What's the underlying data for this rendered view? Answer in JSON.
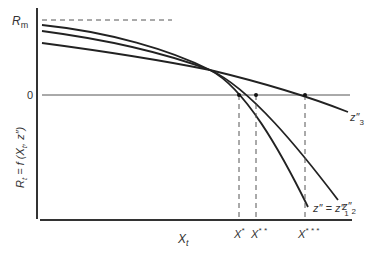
{
  "diagram": {
    "type": "economics-curve-diagram",
    "y_axis_label": {
      "main": "R",
      "sub": "t",
      "rest": " = f (X",
      "sub2": "t",
      "rest2": ", z″)"
    },
    "x_axis_label": {
      "main": "X",
      "sub": "t"
    },
    "y_ticks": {
      "rm": {
        "main": "R",
        "sub": "m"
      },
      "zero": "0"
    },
    "curves": [
      {
        "name": "z1",
        "label_main": "z″ = z″",
        "label_sub": "1"
      },
      {
        "name": "z2",
        "label_main": "z″",
        "label_sub": "2"
      },
      {
        "name": "z3",
        "label_main": "z″",
        "label_sub": "3"
      }
    ],
    "x_markers": [
      {
        "label": "X",
        "sup": "*"
      },
      {
        "label": "X",
        "sup": "* *"
      },
      {
        "label": "X",
        "sup": "* * *"
      }
    ],
    "colors": {
      "ink": "#333333",
      "dash": "#555555"
    }
  }
}
